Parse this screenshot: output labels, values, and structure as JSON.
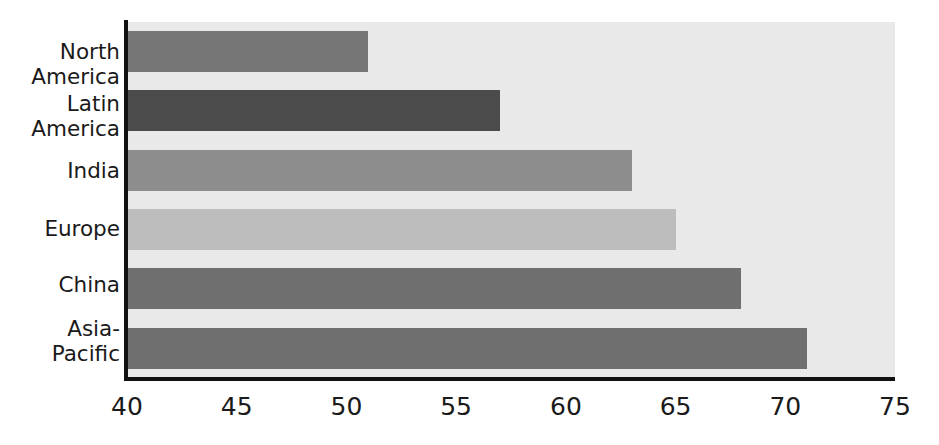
{
  "chart_data": {
    "type": "bar",
    "orientation": "horizontal",
    "title": "",
    "subtitle": "",
    "xlabel": "",
    "ylabel": "",
    "xlim": [
      40,
      75
    ],
    "xticks": [
      "40",
      "45",
      "50",
      "55",
      "60",
      "65",
      "70",
      "75"
    ],
    "xtick_values": [
      40,
      45,
      50,
      55,
      60,
      65,
      70,
      75
    ],
    "grid": false,
    "legend": "none",
    "categories": [
      "North\nAmerica",
      "Latin\nAmerica",
      "India",
      "Europe",
      "China",
      "Asia-\nPacific"
    ],
    "values": [
      51,
      57,
      63,
      65,
      68,
      71
    ],
    "bar_colors": [
      "#767676",
      "#4b4b4b",
      "#8d8d8d",
      "#bdbdbd",
      "#6f6f6f",
      "#6f6f6f"
    ],
    "plot_background": "#e9e9e9",
    "axis_color": "#111111",
    "text_color": "#1a1a1a"
  }
}
